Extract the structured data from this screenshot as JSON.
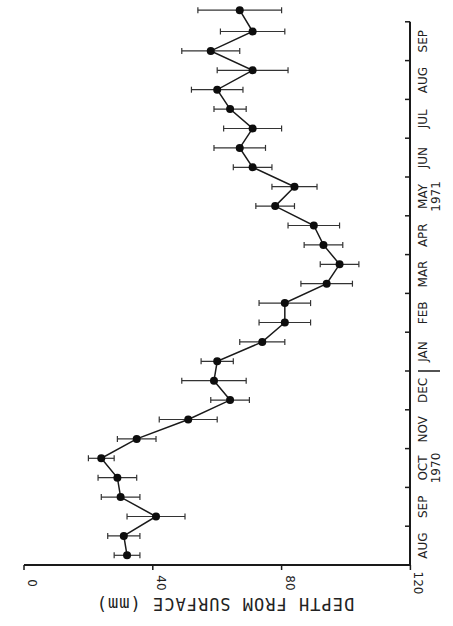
{
  "chart_data": {
    "type": "line",
    "orientation": "rotated-90-clockwise",
    "title": "",
    "xlabel": "",
    "ylabel": "DEPTH FROM SURFACE (mm)",
    "ylim": [
      0,
      120
    ],
    "yticks": [
      0,
      40,
      80,
      120
    ],
    "month_labels": [
      "AUG",
      "SEP",
      "OCT",
      "NOV",
      "DEC",
      "JAN",
      "FEB",
      "MAR",
      "APR",
      "MAY",
      "JUN",
      "JUL",
      "AUG",
      "SEP"
    ],
    "year_labels": [
      {
        "month_index": 2,
        "label": "1970"
      },
      {
        "month_index": 9,
        "label": "1971"
      }
    ],
    "year_divider_after_index": 4,
    "grid": false,
    "legend": null,
    "series": [
      {
        "name": "Depth",
        "x_month_pos": [
          0.25,
          0.75,
          1.25,
          1.75,
          2.25,
          2.75,
          3.25,
          3.75,
          4.25,
          4.75,
          5.25,
          5.75,
          6.25,
          6.75,
          7.25,
          7.75,
          8.25,
          8.75,
          9.25,
          9.75,
          10.25,
          10.75,
          11.25,
          11.75,
          12.25,
          12.75,
          13.25,
          13.75,
          14.3
        ],
        "values": [
          32,
          31,
          41,
          30,
          29,
          24,
          35,
          51,
          64,
          59,
          60,
          74,
          81,
          81,
          94,
          98,
          93,
          90,
          78,
          84,
          71,
          67,
          71,
          64,
          60,
          71,
          58,
          71,
          67
        ],
        "error": [
          4,
          5,
          9,
          6,
          6,
          4,
          6,
          9,
          6,
          10,
          5,
          7,
          8,
          8,
          8,
          6,
          6,
          8,
          6,
          7,
          6,
          8,
          9,
          5,
          8,
          11,
          9,
          10,
          13
        ]
      }
    ]
  },
  "axis": {
    "depth_title": "DEPTH FROM SURFACE (mm)"
  }
}
